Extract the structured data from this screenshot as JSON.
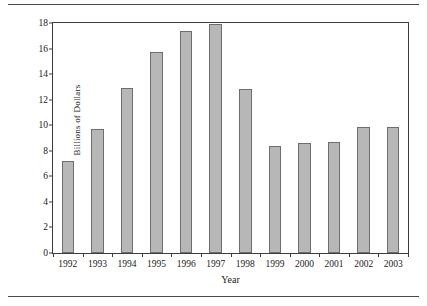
{
  "chart_data": {
    "type": "bar",
    "title": "",
    "xlabel": "Year",
    "ylabel": "Billions of Dollars",
    "categories": [
      "1992",
      "1993",
      "1994",
      "1995",
      "1996",
      "1997",
      "1998",
      "1999",
      "2000",
      "2001",
      "2002",
      "2003"
    ],
    "values": [
      7.2,
      9.7,
      12.9,
      15.7,
      17.4,
      17.9,
      12.8,
      8.4,
      8.6,
      8.7,
      9.85,
      9.85
    ],
    "ylim": [
      0,
      18
    ],
    "yticks": [
      0,
      2,
      4,
      6,
      8,
      10,
      12,
      14,
      16,
      18
    ],
    "ytick_labels": [
      "0",
      "2",
      "4",
      "6",
      "8",
      "10",
      "12",
      "14",
      "16",
      "18"
    ],
    "grid": false,
    "legend": null,
    "bar_color": "#b7b7b7",
    "bar_border_color": "#6e6e6e",
    "axis_color": "#3d3d3d",
    "rule_color": "#4a4a4a"
  }
}
